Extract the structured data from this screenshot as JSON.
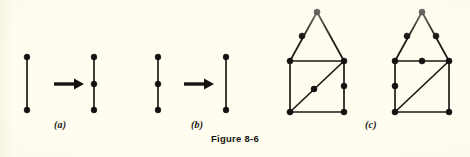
{
  "figure": {
    "caption": "Figure 8-6",
    "background_color": "#fffdf0",
    "ink_color": "#1c1a15"
  },
  "panels": [
    {
      "id": "a",
      "label": "(a)",
      "operation": "edge-subdivision",
      "description": "A single edge with two endpoints is transformed into a path with an added interior vertex.",
      "left_figure": {
        "name": "single-edge",
        "vertex_count": 2,
        "edge_count": 1,
        "vertices": [
          {
            "id": "a-l-top",
            "x": 27,
            "y": 57
          },
          {
            "id": "a-l-bottom",
            "x": 27,
            "y": 110
          }
        ],
        "edges": [
          [
            "a-l-top",
            "a-l-bottom"
          ]
        ]
      },
      "arrow": {
        "name": "transform-arrow",
        "from_x": 54,
        "to_x": 82,
        "y": 84,
        "direction": "right"
      },
      "right_figure": {
        "name": "subdivided-edge",
        "vertex_count": 3,
        "edge_count": 2,
        "vertices": [
          {
            "id": "a-r-top",
            "x": 94,
            "y": 57
          },
          {
            "id": "a-r-mid",
            "x": 94,
            "y": 84
          },
          {
            "id": "a-r-bottom",
            "x": 94,
            "y": 110
          }
        ],
        "edges": [
          [
            "a-r-top",
            "a-r-mid"
          ],
          [
            "a-r-mid",
            "a-r-bottom"
          ]
        ]
      }
    },
    {
      "id": "b",
      "label": "(b)",
      "operation": "edge-smoothing",
      "description": "A path with a degree-two interior vertex is transformed into a single edge.",
      "left_figure": {
        "name": "subdivided-edge",
        "vertex_count": 3,
        "edge_count": 2,
        "vertices": [
          {
            "id": "b-l-top",
            "x": 158,
            "y": 57
          },
          {
            "id": "b-l-mid",
            "x": 158,
            "y": 84
          },
          {
            "id": "b-l-bottom",
            "x": 158,
            "y": 110
          }
        ],
        "edges": [
          [
            "b-l-top",
            "b-l-mid"
          ],
          [
            "b-l-mid",
            "b-l-bottom"
          ]
        ]
      },
      "arrow": {
        "name": "transform-arrow",
        "from_x": 184,
        "to_x": 212,
        "y": 84,
        "direction": "right"
      },
      "right_figure": {
        "name": "single-edge",
        "vertex_count": 2,
        "edge_count": 1,
        "vertices": [
          {
            "id": "b-r-top",
            "x": 226,
            "y": 57
          },
          {
            "id": "b-r-bottom",
            "x": 226,
            "y": 110
          }
        ],
        "edges": [
          [
            "b-r-top",
            "b-r-bottom"
          ]
        ]
      }
    },
    {
      "id": "c",
      "label": "(c)",
      "operation": "homeomorphic-graphs",
      "description": "Two homeomorphic house-shaped graphs: a triangular roof over a square with one diagonal, differing only in where degree-two vertices are placed.",
      "graphs": [
        {
          "name": "house-graph-left",
          "vertex_count": 9,
          "corner_vertices": [
            {
              "id": "L-apex",
              "x": 317,
              "y": 12
            },
            {
              "id": "L-tl",
              "x": 290,
              "y": 61
            },
            {
              "id": "L-tr",
              "x": 344,
              "y": 61
            },
            {
              "id": "L-bl",
              "x": 290,
              "y": 112
            },
            {
              "id": "L-br",
              "x": 344,
              "y": 112
            }
          ],
          "subdivision_vertices": [
            {
              "id": "L-roof-left-mid",
              "x": 302,
              "y": 36,
              "on_edge": "L-apex-L-tl"
            },
            {
              "id": "L-right-mid",
              "x": 344,
              "y": 86,
              "on_edge": "L-tr-L-br"
            },
            {
              "id": "L-diag-mid",
              "x": 314,
              "y": 89,
              "on_edge": "L-bl-L-tr"
            }
          ],
          "edges": [
            [
              "L-apex",
              "L-roof-left-mid"
            ],
            [
              "L-roof-left-mid",
              "L-tl"
            ],
            [
              "L-apex",
              "L-tr"
            ],
            [
              "L-tl",
              "L-tr"
            ],
            [
              "L-tl",
              "L-bl"
            ],
            [
              "L-tr",
              "L-right-mid"
            ],
            [
              "L-right-mid",
              "L-br"
            ],
            [
              "L-bl",
              "L-br"
            ],
            [
              "L-bl",
              "L-diag-mid"
            ],
            [
              "L-diag-mid",
              "L-tr"
            ]
          ]
        },
        {
          "name": "house-graph-right",
          "vertex_count": 9,
          "corner_vertices": [
            {
              "id": "R-apex",
              "x": 422,
              "y": 12
            },
            {
              "id": "R-tl",
              "x": 395,
              "y": 61
            },
            {
              "id": "R-tr",
              "x": 449,
              "y": 61
            },
            {
              "id": "R-bl",
              "x": 395,
              "y": 112
            },
            {
              "id": "R-br",
              "x": 449,
              "y": 112
            }
          ],
          "subdivision_vertices": [
            {
              "id": "R-roof-left-mid",
              "x": 407,
              "y": 36,
              "on_edge": "R-apex-R-tl"
            },
            {
              "id": "R-roof-right-mid",
              "x": 436,
              "y": 36,
              "on_edge": "R-apex-R-tr"
            },
            {
              "id": "R-top-mid",
              "x": 422,
              "y": 61,
              "on_edge": "R-tl-R-tr"
            },
            {
              "id": "R-left-mid",
              "x": 395,
              "y": 86,
              "on_edge": "R-tl-R-bl"
            }
          ],
          "edges": [
            [
              "R-apex",
              "R-roof-left-mid"
            ],
            [
              "R-roof-left-mid",
              "R-tl"
            ],
            [
              "R-apex",
              "R-roof-right-mid"
            ],
            [
              "R-roof-right-mid",
              "R-tr"
            ],
            [
              "R-tl",
              "R-top-mid"
            ],
            [
              "R-top-mid",
              "R-tr"
            ],
            [
              "R-tl",
              "R-left-mid"
            ],
            [
              "R-left-mid",
              "R-bl"
            ],
            [
              "R-tr",
              "R-br"
            ],
            [
              "R-bl",
              "R-br"
            ],
            [
              "R-bl",
              "R-tr"
            ]
          ]
        }
      ]
    }
  ]
}
